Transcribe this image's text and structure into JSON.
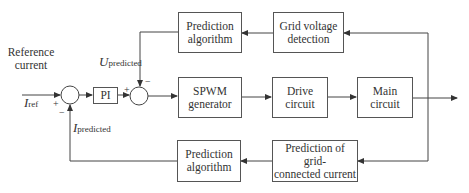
{
  "diagram": {
    "type": "control block diagram",
    "input": {
      "label_line1": "Reference",
      "label_line2": "current",
      "symbol": "I",
      "subscript": "ref"
    },
    "blocks": {
      "pi": "PI",
      "spwm": {
        "line1": "SPWM",
        "line2": "generator"
      },
      "drive": {
        "line1": "Drive",
        "line2": "circuit"
      },
      "main": {
        "line1": "Main",
        "line2": "circuit"
      },
      "pred_top": {
        "line1": "Prediction",
        "line2": "algorithm"
      },
      "grid_voltage": {
        "line1": "Grid voltage",
        "line2": "detection"
      },
      "pred_bottom": {
        "line1": "Prediction",
        "line2": "algorithm"
      },
      "pred_current": {
        "line1": "Prediction of grid-",
        "line2": "connected current"
      }
    },
    "signals": {
      "u_pred": {
        "symbol": "U",
        "subscript": "predicted"
      },
      "i_pred": {
        "symbol": "I",
        "subscript": "predicted"
      }
    },
    "signs": {
      "sum1_plus": "+",
      "sum1_minus": "−",
      "sum2_plus": "+",
      "sum2_minus": "−"
    },
    "colors": {
      "line": "#444444",
      "box_border": "#555555",
      "text": "#333333"
    }
  }
}
